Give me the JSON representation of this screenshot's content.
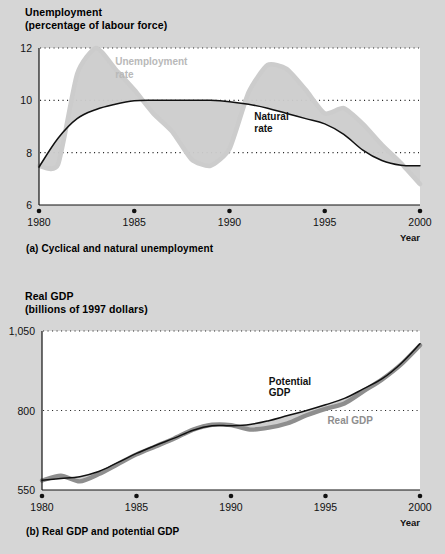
{
  "figure": {
    "background_color": "#d6d6d6",
    "plot_background_color": "#ffffff",
    "band_color": "#cccccc",
    "dark_line_color": "#111111",
    "gray_line_color": "#8e8e8e"
  },
  "panel_a": {
    "caption": "(a) Cyclical and natural unemployment",
    "axis_title": "Unemployment",
    "axis_subtitle": "(percentage of labour force)",
    "year_label": "Year"
  },
  "panel_b": {
    "caption": "(b) Real GDP and potential GDP",
    "axis_title": "Real GDP",
    "axis_subtitle": "(billions of 1997 dollars)",
    "year_label": "Year"
  },
  "chart_data": [
    {
      "type": "line",
      "id": "unemployment",
      "title": "Unemployment",
      "subtitle": "(percentage of labour force)",
      "xlabel": "Year",
      "ylabel": "Unemployment (percentage of labour force)",
      "xlim": [
        1980,
        2000
      ],
      "ylim": [
        6,
        12
      ],
      "yticks": [
        6,
        8,
        10,
        12
      ],
      "ytick_labels": [
        "6",
        "8",
        "10",
        "12"
      ],
      "xticks": [
        1980,
        1985,
        1990,
        1995,
        2000
      ],
      "xtick_labels": [
        "1980",
        "1985",
        "1990",
        "1995",
        "2000"
      ],
      "grid": "horizontal-dotted",
      "legend": "in-plot annotations",
      "annotations": [
        {
          "text": "Unemployment",
          "style": "light-gray",
          "x": 1984.0,
          "y": 11.35
        },
        {
          "text": "rate",
          "style": "light-gray",
          "x": 1984.0,
          "y": 10.85
        },
        {
          "text": "Natural",
          "style": "bold-black",
          "x": 1991.3,
          "y": 9.25
        },
        {
          "text": "rate",
          "style": "bold-black",
          "x": 1991.3,
          "y": 8.8
        }
      ],
      "x": [
        1980,
        1981,
        1982,
        1983,
        1984,
        1985,
        1986,
        1987,
        1988,
        1989,
        1990,
        1991,
        1992,
        1993,
        1994,
        1995,
        1996,
        1997,
        1998,
        1999,
        2000
      ],
      "series": [
        {
          "name": "Unemployment rate",
          "color": "#cccccc",
          "values": [
            7.5,
            7.55,
            11.0,
            12.0,
            11.2,
            10.4,
            9.5,
            8.8,
            7.75,
            7.5,
            8.15,
            10.3,
            11.35,
            11.2,
            10.4,
            9.5,
            9.7,
            9.1,
            8.3,
            7.6,
            6.8
          ]
        },
        {
          "name": "Natural rate",
          "color": "#111111",
          "values": [
            7.45,
            8.55,
            9.3,
            9.65,
            9.85,
            9.98,
            10.0,
            10.0,
            10.0,
            10.0,
            9.95,
            9.85,
            9.7,
            9.5,
            9.3,
            9.1,
            8.7,
            8.1,
            7.7,
            7.52,
            7.5
          ]
        }
      ]
    },
    {
      "type": "line",
      "id": "real-gdp",
      "title": "Real GDP",
      "subtitle": "(billions of 1997 dollars)",
      "xlabel": "Year",
      "ylabel": "Real GDP (billions of 1997 dollars)",
      "xlim": [
        1980,
        2000
      ],
      "ylim": [
        550,
        1050
      ],
      "yticks": [
        550,
        800,
        1050
      ],
      "ytick_labels": [
        "550",
        "800",
        "1,050"
      ],
      "xticks": [
        1980,
        1985,
        1990,
        1995,
        2000
      ],
      "xtick_labels": [
        "1980",
        "1985",
        "1990",
        "1995",
        "2000"
      ],
      "grid": "horizontal-dotted",
      "legend": "in-plot annotations",
      "annotations": [
        {
          "text": "Potential",
          "style": "bold-black",
          "x": 1992.0,
          "y": 880
        },
        {
          "text": "GDP",
          "style": "bold-black",
          "x": 1992.0,
          "y": 845
        },
        {
          "text": "Real GDP",
          "style": "mid-gray",
          "x": 1995.1,
          "y": 757
        }
      ],
      "x": [
        1980,
        1981,
        1982,
        1983,
        1984,
        1985,
        1986,
        1987,
        1988,
        1989,
        1990,
        1991,
        1992,
        1993,
        1994,
        1995,
        1996,
        1997,
        1998,
        1999,
        2000
      ],
      "series": [
        {
          "name": "Real GDP",
          "color": "#8e8e8e",
          "values": [
            580,
            595,
            577,
            600,
            631,
            662,
            687,
            712,
            740,
            755,
            754,
            740,
            746,
            760,
            785,
            805,
            822,
            860,
            898,
            945,
            1005
          ]
        },
        {
          "name": "Potential GDP",
          "color": "#111111",
          "values": [
            581,
            586,
            592,
            608,
            636,
            665,
            690,
            713,
            738,
            752,
            752,
            756,
            768,
            784,
            800,
            818,
            838,
            868,
            900,
            948,
            1010
          ]
        }
      ]
    }
  ]
}
